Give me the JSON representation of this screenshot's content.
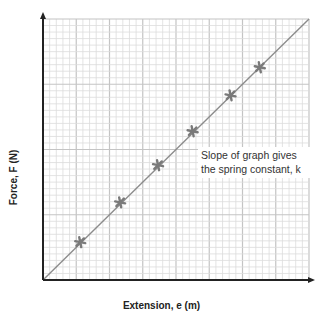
{
  "chart_data": {
    "type": "scatter",
    "title": "",
    "xlabel": "Extension, e (m)",
    "ylabel": "Force, F (N)",
    "annotation": "Slope of graph gives the spring constant, k",
    "grid": true,
    "grid_units": "minor grid squares (no numeric tick labels shown)",
    "xlim": [
      0,
      40
    ],
    "ylim": [
      0,
      40
    ],
    "x_major_every": 5,
    "y_major_every": 10,
    "series": [
      {
        "name": "measurements",
        "marker": "asterisk",
        "x": [
          5.6,
          11.6,
          17.3,
          22.5,
          28.2,
          32.6
        ],
        "y": [
          5.8,
          11.9,
          17.6,
          22.8,
          28.3,
          32.6
        ]
      },
      {
        "name": "line of best fit",
        "type": "line",
        "x": [
          0,
          40
        ],
        "y": [
          0,
          40
        ]
      }
    ],
    "colors": {
      "axis": "#222222",
      "grid_minor": "#dcdcdc",
      "grid_major": "#c4c4c4",
      "line": "#8c8c8c",
      "marker": "#7a7a7a"
    }
  },
  "labels": {
    "xlabel": "Extension, e (m)",
    "ylabel": "Force, F (N)",
    "annotation": "Slope of graph gives the spring constant, k"
  }
}
